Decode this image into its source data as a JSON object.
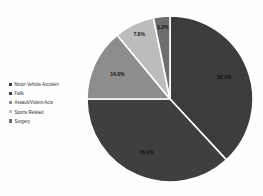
{
  "chart_data": {
    "type": "pie",
    "title": "",
    "categories": [
      "Motor Vehicle Accident",
      "Falls",
      "Assault/Violent Acts",
      "Sports Related",
      "Surgery"
    ],
    "values": [
      38.1,
      36.9,
      14.0,
      7.8,
      3.2
    ],
    "value_labels": [
      "38.1%",
      "36.9%",
      "14.0%",
      "7.8%",
      "3.2%"
    ],
    "colors": [
      "#3c3c3c",
      "#3f3f3f",
      "#8d8d8d",
      "#bcbcbc",
      "#6d6d6d"
    ],
    "units": "percent",
    "total": 100.0,
    "legend_position": "left",
    "grid": false,
    "xlabel": "",
    "ylabel": ""
  },
  "legend": {
    "items": [
      {
        "label": "Motor Vehicle Accident",
        "color": "#3c3c3c"
      },
      {
        "label": "Falls",
        "color": "#3f3f3f"
      },
      {
        "label": "Assault/Violent Acts",
        "color": "#8d8d8d"
      },
      {
        "label": "Sports Related",
        "color": "#bcbcbc"
      },
      {
        "label": "Surgery",
        "color": "#6d6d6d"
      }
    ]
  },
  "slice_labels": {
    "motor_vehicle_accident": "38.1%",
    "falls": "36.9%",
    "assault_violent_acts": "14.0%",
    "sports_related": "7.8%",
    "surgery": "3.2%"
  },
  "style": {
    "background": "#fefefe",
    "separator": "#ffffff",
    "text": "#2b2b2b"
  }
}
